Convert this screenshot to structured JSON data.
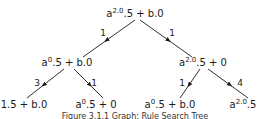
{
  "tree": {
    "nodes": [
      {
        "id": "root",
        "base": "a",
        "exp": "2.0",
        "rest": ".5 + b.0"
      },
      {
        "id": "left",
        "base": "a",
        "exp": "0",
        "rest": ".5 + b.0"
      },
      {
        "id": "right",
        "base": "a",
        "exp": "2.0",
        "rest": ".5 + 0"
      },
      {
        "id": "leaf-ll",
        "base": "",
        "exp": "",
        "rest": "1.5 + b.0"
      },
      {
        "id": "leaf-lr",
        "base": "a",
        "exp": "0",
        "rest": ".5 + 0"
      },
      {
        "id": "leaf-rl",
        "base": "a",
        "exp": "0",
        "rest": ".5 + b.0"
      },
      {
        "id": "leaf-rr",
        "base": "a",
        "exp": "2.0",
        "rest": ".5"
      }
    ],
    "edges": [
      {
        "from": "root",
        "to": "left",
        "label": "1"
      },
      {
        "from": "root",
        "to": "right",
        "label": "1"
      },
      {
        "from": "left",
        "to": "leaf-ll",
        "label": "3"
      },
      {
        "from": "left",
        "to": "leaf-lr",
        "label": "1"
      },
      {
        "from": "right",
        "to": "leaf-rl",
        "label": "1"
      },
      {
        "from": "right",
        "to": "leaf-rr",
        "label": "4"
      }
    ]
  },
  "caption": "Figure 3.1.1 Graph: Rule Search Tree"
}
